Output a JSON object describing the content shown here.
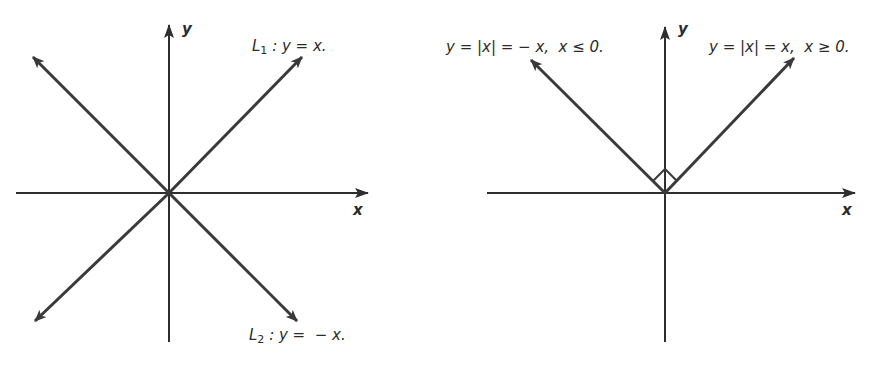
{
  "figures": [
    {
      "id": "left",
      "title": "Perpendicular lines y = x and y = -x",
      "axes": {
        "x_label": "x",
        "y_label": "y"
      },
      "lines": [
        {
          "name": "L1",
          "equation": "y = x",
          "label_prefix": "L",
          "label_sub": "1",
          "label_rest": " : y = x."
        },
        {
          "name": "L2",
          "equation": "y = -x",
          "label_prefix": "L",
          "label_sub": "2",
          "label_rest": " : y =  − x."
        }
      ]
    },
    {
      "id": "right",
      "title": "Graph of y = |x|",
      "axes": {
        "x_label": "x",
        "y_label": "y"
      },
      "branches": [
        {
          "side": "left",
          "label": "y = |x| = − x,  x ≤ 0."
        },
        {
          "side": "right",
          "label": "y = |x| = x,  x ≥ 0."
        }
      ],
      "right_angle_marker": true
    }
  ],
  "colors": {
    "line": "#3a3a3a",
    "axis": "#2e2e2e",
    "text": "#2b2b2b",
    "background": "#ffffff"
  }
}
